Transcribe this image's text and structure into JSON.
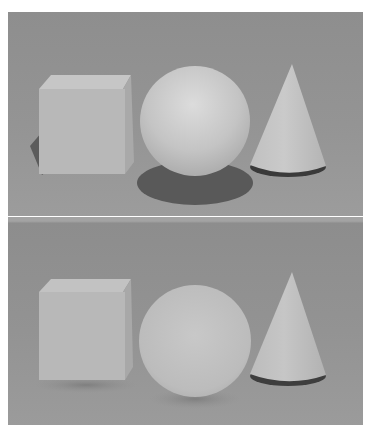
{
  "figure": {
    "panels": [
      {
        "id": "top",
        "description": "Cube, sphere and cone rendered with hard cast shadows",
        "objects": [
          "cube",
          "sphere",
          "cone"
        ],
        "shadows": "hard"
      },
      {
        "id": "bottom",
        "description": "Same cube, sphere and cone rendered with soft ambient lighting",
        "objects": [
          "cube",
          "sphere",
          "cone"
        ],
        "shadows": "soft"
      }
    ],
    "colors": {
      "background": "#939393",
      "object_light": "#c8c8c8",
      "object_mid": "#b4b4b4",
      "shadow": "#5a5a5a"
    }
  }
}
